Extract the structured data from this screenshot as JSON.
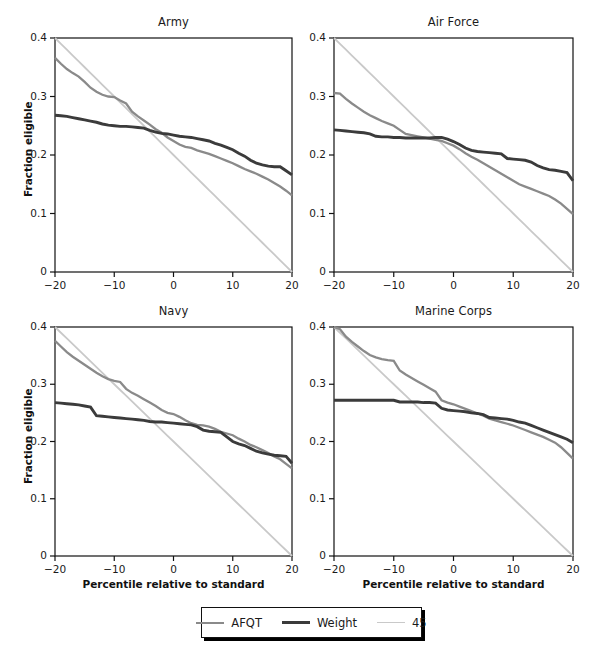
{
  "figure": {
    "width": 595,
    "height": 656,
    "background": "#ffffff"
  },
  "legend": {
    "position": "bottom-center",
    "items": [
      {
        "label": "AFQT",
        "color": "#8a8a8a",
        "width": 2.2
      },
      {
        "label": "Weight",
        "color": "#3b3b3b",
        "width": 3.0
      },
      {
        "label": "45",
        "color": "#c9c9c9",
        "width": 1.8
      }
    ]
  },
  "axes": {
    "xlabel": "Percentile relative to standard",
    "ylabel": "Fraction eligible",
    "xlim": [
      -20,
      20
    ],
    "ylim": [
      0,
      0.4
    ],
    "xticks": [
      -20,
      -10,
      0,
      10,
      20
    ],
    "xticklabels": [
      "−20",
      "−10",
      "0",
      "10",
      "20"
    ],
    "yticks": [
      0,
      0.1,
      0.2,
      0.3,
      0.4
    ],
    "yticklabels": [
      "0",
      "0.1",
      "0.2",
      "0.3",
      "0.4"
    ],
    "grid": false
  },
  "panels": [
    {
      "title": "Army",
      "row": 0,
      "col": 0,
      "show_ylabel": true,
      "show_xlabel": false,
      "show_yticks": true,
      "show_xticks": true
    },
    {
      "title": "Air Force",
      "row": 0,
      "col": 1,
      "show_ylabel": false,
      "show_xlabel": false,
      "show_yticks": true,
      "show_xticks": true
    },
    {
      "title": "Navy",
      "row": 1,
      "col": 0,
      "show_ylabel": true,
      "show_xlabel": true,
      "show_yticks": true,
      "show_xticks": true
    },
    {
      "title": "Marine Corps",
      "row": 1,
      "col": 1,
      "show_ylabel": false,
      "show_xlabel": true,
      "show_yticks": true,
      "show_xticks": true
    }
  ],
  "chart_data": {
    "type": "line",
    "xlabel": "Percentile relative to standard",
    "ylabel": "Fraction eligible",
    "xlim": [
      -20,
      20
    ],
    "ylim": [
      0,
      0.4
    ],
    "xticks": [
      -20,
      -10,
      0,
      10,
      20
    ],
    "yticks": [
      0,
      0.1,
      0.2,
      0.3,
      0.4
    ],
    "grid": false,
    "legend_position": "bottom-center",
    "legend_entries": [
      "AFQT",
      "Weight",
      "45"
    ],
    "panels": [
      {
        "title": "Army",
        "x": [
          -20,
          -19,
          -18,
          -17,
          -16,
          -15,
          -14,
          -13,
          -12,
          -11,
          -10,
          -9,
          -8,
          -7,
          -6,
          -5,
          -4,
          -3,
          -2,
          -1,
          0,
          1,
          2,
          3,
          4,
          5,
          6,
          7,
          8,
          9,
          10,
          11,
          12,
          13,
          14,
          15,
          16,
          17,
          18,
          19,
          20
        ],
        "series": [
          {
            "name": "AFQT",
            "color": "#8a8a8a",
            "values": [
              0.366,
              0.356,
              0.347,
              0.34,
              0.334,
              0.325,
              0.315,
              0.308,
              0.303,
              0.3,
              0.299,
              0.293,
              0.288,
              0.274,
              0.266,
              0.259,
              0.252,
              0.244,
              0.238,
              0.23,
              0.224,
              0.218,
              0.214,
              0.212,
              0.208,
              0.205,
              0.202,
              0.198,
              0.194,
              0.19,
              0.186,
              0.181,
              0.176,
              0.172,
              0.168,
              0.163,
              0.158,
              0.152,
              0.146,
              0.139,
              0.131
            ]
          },
          {
            "name": "Weight",
            "color": "#3b3b3b",
            "values": [
              0.268,
              0.267,
              0.266,
              0.264,
              0.262,
              0.26,
              0.258,
              0.256,
              0.253,
              0.251,
              0.25,
              0.249,
              0.249,
              0.248,
              0.247,
              0.246,
              0.242,
              0.239,
              0.237,
              0.236,
              0.234,
              0.232,
              0.231,
              0.23,
              0.228,
              0.226,
              0.224,
              0.22,
              0.217,
              0.213,
              0.209,
              0.203,
              0.198,
              0.191,
              0.186,
              0.183,
              0.181,
              0.18,
              0.18,
              0.173,
              0.166
            ]
          },
          {
            "name": "45",
            "color": "#c9c9c9",
            "values": [
              0.4,
              0.39,
              0.38,
              0.37,
              0.36,
              0.35,
              0.34,
              0.33,
              0.32,
              0.31,
              0.3,
              0.29,
              0.28,
              0.27,
              0.26,
              0.25,
              0.24,
              0.23,
              0.22,
              0.21,
              0.2,
              0.19,
              0.18,
              0.17,
              0.16,
              0.15,
              0.14,
              0.13,
              0.12,
              0.11,
              0.1,
              0.09,
              0.08,
              0.07,
              0.06,
              0.05,
              0.04,
              0.03,
              0.02,
              0.01,
              0.0
            ]
          }
        ]
      },
      {
        "title": "Air Force",
        "x": [
          -20,
          -19,
          -18,
          -17,
          -16,
          -15,
          -14,
          -13,
          -12,
          -11,
          -10,
          -9,
          -8,
          -7,
          -6,
          -5,
          -4,
          -3,
          -2,
          -1,
          0,
          1,
          2,
          3,
          4,
          5,
          6,
          7,
          8,
          9,
          10,
          11,
          12,
          13,
          14,
          15,
          16,
          17,
          18,
          19,
          20
        ],
        "series": [
          {
            "name": "AFQT",
            "color": "#8a8a8a",
            "values": [
              0.306,
              0.305,
              0.296,
              0.288,
              0.281,
              0.274,
              0.268,
              0.263,
              0.258,
              0.254,
              0.25,
              0.243,
              0.236,
              0.234,
              0.232,
              0.23,
              0.228,
              0.226,
              0.224,
              0.22,
              0.216,
              0.21,
              0.203,
              0.197,
              0.192,
              0.186,
              0.18,
              0.174,
              0.168,
              0.162,
              0.156,
              0.15,
              0.146,
              0.142,
              0.138,
              0.134,
              0.13,
              0.124,
              0.117,
              0.108,
              0.099
            ]
          },
          {
            "name": "Weight",
            "color": "#3b3b3b",
            "values": [
              0.243,
              0.242,
              0.241,
              0.24,
              0.239,
              0.238,
              0.236,
              0.232,
              0.231,
              0.231,
              0.23,
              0.23,
              0.229,
              0.229,
              0.229,
              0.229,
              0.229,
              0.23,
              0.23,
              0.227,
              0.223,
              0.218,
              0.212,
              0.208,
              0.206,
              0.205,
              0.204,
              0.203,
              0.202,
              0.194,
              0.193,
              0.192,
              0.191,
              0.188,
              0.182,
              0.178,
              0.175,
              0.174,
              0.172,
              0.17,
              0.156
            ]
          },
          {
            "name": "45",
            "color": "#c9c9c9",
            "values": [
              0.4,
              0.39,
              0.38,
              0.37,
              0.36,
              0.35,
              0.34,
              0.33,
              0.32,
              0.31,
              0.3,
              0.29,
              0.28,
              0.27,
              0.26,
              0.25,
              0.24,
              0.23,
              0.22,
              0.21,
              0.2,
              0.19,
              0.18,
              0.17,
              0.16,
              0.15,
              0.14,
              0.13,
              0.12,
              0.11,
              0.1,
              0.09,
              0.08,
              0.07,
              0.06,
              0.05,
              0.04,
              0.03,
              0.02,
              0.01,
              0.0
            ]
          }
        ]
      },
      {
        "title": "Navy",
        "x": [
          -20,
          -19,
          -18,
          -17,
          -16,
          -15,
          -14,
          -13,
          -12,
          -11,
          -10,
          -9,
          -8,
          -7,
          -6,
          -5,
          -4,
          -3,
          -2,
          -1,
          0,
          1,
          2,
          3,
          4,
          5,
          6,
          7,
          8,
          9,
          10,
          11,
          12,
          13,
          14,
          15,
          16,
          17,
          18,
          19,
          20
        ],
        "series": [
          {
            "name": "AFQT",
            "color": "#8a8a8a",
            "values": [
              0.376,
              0.366,
              0.356,
              0.348,
              0.341,
              0.334,
              0.327,
              0.32,
              0.314,
              0.309,
              0.306,
              0.304,
              0.292,
              0.285,
              0.28,
              0.274,
              0.268,
              0.262,
              0.255,
              0.25,
              0.248,
              0.243,
              0.237,
              0.232,
              0.229,
              0.228,
              0.226,
              0.222,
              0.217,
              0.214,
              0.211,
              0.205,
              0.2,
              0.194,
              0.19,
              0.185,
              0.18,
              0.174,
              0.169,
              0.161,
              0.153
            ]
          },
          {
            "name": "Weight",
            "color": "#3b3b3b",
            "values": [
              0.268,
              0.267,
              0.266,
              0.265,
              0.264,
              0.262,
              0.26,
              0.245,
              0.244,
              0.243,
              0.242,
              0.241,
              0.24,
              0.239,
              0.238,
              0.237,
              0.235,
              0.234,
              0.234,
              0.233,
              0.232,
              0.231,
              0.23,
              0.229,
              0.226,
              0.22,
              0.218,
              0.217,
              0.216,
              0.208,
              0.2,
              0.196,
              0.193,
              0.188,
              0.183,
              0.18,
              0.178,
              0.176,
              0.175,
              0.174,
              0.162
            ]
          },
          {
            "name": "45",
            "color": "#c9c9c9",
            "values": [
              0.4,
              0.39,
              0.38,
              0.37,
              0.36,
              0.35,
              0.34,
              0.33,
              0.32,
              0.31,
              0.3,
              0.29,
              0.28,
              0.27,
              0.26,
              0.25,
              0.24,
              0.23,
              0.22,
              0.21,
              0.2,
              0.19,
              0.18,
              0.17,
              0.16,
              0.15,
              0.14,
              0.13,
              0.12,
              0.11,
              0.1,
              0.09,
              0.08,
              0.07,
              0.06,
              0.05,
              0.04,
              0.03,
              0.02,
              0.01,
              0.0
            ]
          }
        ]
      },
      {
        "title": "Marine Corps",
        "x": [
          -20,
          -19,
          -18,
          -17,
          -16,
          -15,
          -14,
          -13,
          -12,
          -11,
          -10,
          -9,
          -8,
          -7,
          -6,
          -5,
          -4,
          -3,
          -2,
          -1,
          0,
          1,
          2,
          3,
          4,
          5,
          6,
          7,
          8,
          9,
          10,
          11,
          12,
          13,
          14,
          15,
          16,
          17,
          18,
          19,
          20
        ],
        "series": [
          {
            "name": "AFQT",
            "color": "#8a8a8a",
            "values": [
              0.4,
              0.396,
              0.383,
              0.374,
              0.366,
              0.358,
              0.351,
              0.347,
              0.344,
              0.342,
              0.341,
              0.324,
              0.317,
              0.311,
              0.305,
              0.299,
              0.293,
              0.287,
              0.272,
              0.268,
              0.265,
              0.261,
              0.257,
              0.253,
              0.249,
              0.245,
              0.24,
              0.237,
              0.234,
              0.231,
              0.228,
              0.224,
              0.22,
              0.216,
              0.212,
              0.208,
              0.203,
              0.198,
              0.19,
              0.18,
              0.17
            ]
          },
          {
            "name": "Weight",
            "color": "#3b3b3b",
            "values": [
              0.272,
              0.272,
              0.272,
              0.272,
              0.272,
              0.272,
              0.272,
              0.272,
              0.272,
              0.272,
              0.272,
              0.269,
              0.269,
              0.269,
              0.269,
              0.268,
              0.268,
              0.267,
              0.258,
              0.255,
              0.254,
              0.253,
              0.252,
              0.25,
              0.249,
              0.247,
              0.242,
              0.241,
              0.24,
              0.239,
              0.237,
              0.234,
              0.232,
              0.228,
              0.224,
              0.22,
              0.216,
              0.212,
              0.208,
              0.204,
              0.198
            ]
          },
          {
            "name": "45",
            "color": "#c9c9c9",
            "values": [
              0.4,
              0.39,
              0.38,
              0.37,
              0.36,
              0.35,
              0.34,
              0.33,
              0.32,
              0.31,
              0.3,
              0.29,
              0.28,
              0.27,
              0.26,
              0.25,
              0.24,
              0.23,
              0.22,
              0.21,
              0.2,
              0.19,
              0.18,
              0.17,
              0.16,
              0.15,
              0.14,
              0.13,
              0.12,
              0.11,
              0.1,
              0.09,
              0.08,
              0.07,
              0.06,
              0.05,
              0.04,
              0.03,
              0.02,
              0.01,
              0.0
            ]
          }
        ]
      }
    ]
  }
}
